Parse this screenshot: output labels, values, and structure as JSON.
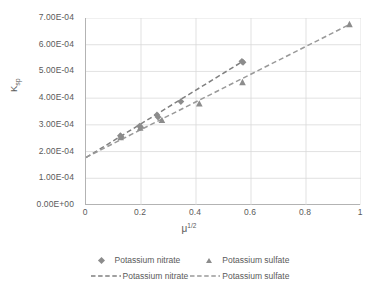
{
  "chart_data": {
    "type": "scatter",
    "title": "",
    "xlabel": "μ^(1/2)",
    "ylabel": "Ksp",
    "xlim": [
      0,
      1
    ],
    "ylim": [
      0,
      0.0007
    ],
    "grid": true,
    "legend_position": "bottom",
    "x_ticks": [
      "0",
      "0.2",
      "0.4",
      "0.6",
      "0.8",
      "1"
    ],
    "x_tick_values": [
      0,
      0.2,
      0.4,
      0.6,
      0.8,
      1
    ],
    "y_ticks": [
      "0.00E+00",
      "1.00E-04",
      "2.00E-04",
      "3.00E-04",
      "4.00E-04",
      "5.00E-04",
      "6.00E-04",
      "7.00E-04"
    ],
    "y_tick_values": [
      0,
      0.0001,
      0.0002,
      0.0003,
      0.0004,
      0.0005,
      0.0006,
      0.0007
    ],
    "series": [
      {
        "name": "Potassium nitrate",
        "marker": "diamond",
        "color": "#8c8c8c",
        "points": [
          {
            "x": 0.125,
            "y": 0.0002595
          },
          {
            "x": 0.128,
            "y": 0.000255
          },
          {
            "x": 0.195,
            "y": 0.0002955
          },
          {
            "x": 0.199,
            "y": 0.000291
          },
          {
            "x": 0.258,
            "y": 0.000337
          },
          {
            "x": 0.262,
            "y": 0.000329
          },
          {
            "x": 0.345,
            "y": 0.000387
          },
          {
            "x": 0.567,
            "y": 0.000538
          },
          {
            "x": 0.571,
            "y": 0.000534
          }
        ]
      },
      {
        "name": "Potassium sulfate",
        "marker": "triangle",
        "color": "#8c8c8c",
        "points": [
          {
            "x": 0.126,
            "y": 0.000253
          },
          {
            "x": 0.197,
            "y": 0.000288
          },
          {
            "x": 0.276,
            "y": 0.000317
          },
          {
            "x": 0.412,
            "y": 0.000379
          },
          {
            "x": 0.569,
            "y": 0.000459
          },
          {
            "x": 0.958,
            "y": 0.000676
          }
        ]
      }
    ],
    "trendlines": [
      {
        "name": "Potassium nitrate",
        "style": "dashed",
        "color": "#808080",
        "intercept": 0.0001775,
        "slope": 0.000632,
        "x_start": 0.0,
        "x_end": 0.571
      },
      {
        "name": "Potassium sulfate",
        "style": "dashed",
        "color": "#999999",
        "intercept": 0.0001785,
        "slope": 0.000519,
        "x_start": 0.0,
        "x_end": 0.958
      }
    ],
    "legend": [
      {
        "label": "Potassium nitrate",
        "key": "diamond-marker"
      },
      {
        "label": "Potassium sulfate",
        "key": "triangle-marker"
      },
      {
        "label": "Potassium nitrate",
        "key": "dashed-line"
      },
      {
        "label": "Potassium sulfate",
        "key": "dashed-line"
      }
    ]
  },
  "axes": {
    "y_title_main": "K",
    "y_title_sub": "sp",
    "x_title_main": "μ",
    "x_title_sup": "1/2"
  },
  "colors": {
    "marker": "#8c8c8c",
    "trend_nitrate": "#808080",
    "trend_sulfate": "#999999",
    "grid": "#d9d9d9",
    "axis": "#b3b3b3",
    "text": "#5a5a5a",
    "background": "#ffffff"
  }
}
